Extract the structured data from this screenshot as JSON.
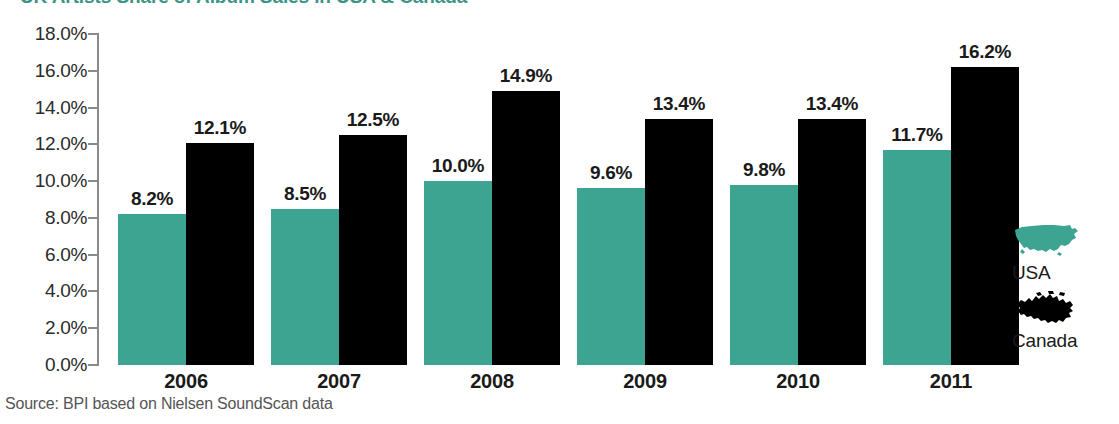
{
  "title": "UK Artists Share of Album Sales in USA & Canada",
  "source_note": "Source: BPI based on Nielsen SoundScan data",
  "colors": {
    "usa": "#3ea492",
    "canada": "#000000",
    "title": "#3d9486",
    "axis": "#8a8a8a",
    "label_text": "#1a1a1a",
    "source_text": "#555555",
    "background": "#ffffff"
  },
  "legend": {
    "position": "right",
    "items": [
      {
        "label": "USA",
        "icon": "usa-map-icon",
        "color": "#3ea492"
      },
      {
        "label": "Canada",
        "icon": "canada-map-icon",
        "color": "#000000"
      }
    ]
  },
  "chart_data": {
    "type": "bar",
    "title": "UK Artists Share of Album Sales in USA & Canada",
    "xlabel": "",
    "ylabel": "",
    "categories": [
      "2006",
      "2007",
      "2008",
      "2009",
      "2010",
      "2011"
    ],
    "series": [
      {
        "name": "USA",
        "color": "#3ea492",
        "values": [
          8.2,
          8.5,
          10.0,
          9.6,
          9.8,
          11.7
        ],
        "value_labels": [
          "8.2%",
          "8.5%",
          "10.0%",
          "9.6%",
          "9.8%",
          "11.7%"
        ]
      },
      {
        "name": "Canada",
        "color": "#000000",
        "values": [
          12.1,
          12.5,
          14.9,
          13.4,
          13.4,
          16.2
        ],
        "value_labels": [
          "12.1%",
          "12.5%",
          "14.9%",
          "13.4%",
          "13.4%",
          "16.2%"
        ]
      }
    ],
    "ylim": [
      0,
      18
    ],
    "ytick_values": [
      0,
      2,
      4,
      6,
      8,
      10,
      12,
      14,
      16,
      18
    ],
    "ytick_labels": [
      "0.0%",
      "2.0%",
      "4.0%",
      "6.0%",
      "8.0%",
      "10.0%",
      "12.0%",
      "14.0%",
      "16.0%",
      "18.0%"
    ],
    "grid": false,
    "legend_position": "right",
    "value_labels_shown": true,
    "units": "percent"
  }
}
